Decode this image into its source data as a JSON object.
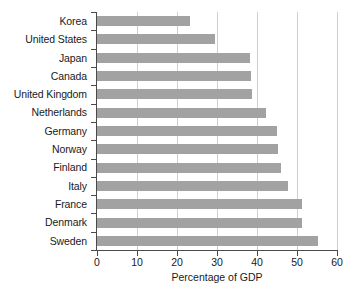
{
  "chart_data": {
    "type": "bar",
    "orientation": "horizontal",
    "title": "",
    "xlabel": "Percentage of GDP",
    "ylabel": "",
    "xlim": [
      0,
      60
    ],
    "xticks": [
      0,
      10,
      20,
      30,
      40,
      50,
      60
    ],
    "xtick_labels": [
      "0",
      "10",
      "20",
      "30",
      "40",
      "50",
      "60"
    ],
    "grid": "vertical",
    "legend": "none",
    "bar_color": "#a2a2a2",
    "background_color": "#ffffff",
    "axis_color": "#4a4a4a",
    "gridline_color": "#cfcfcf",
    "categories": [
      "Korea",
      "United States",
      "Japan",
      "Canada",
      "United Kingdom",
      "Netherlands",
      "Germany",
      "Norway",
      "Finland",
      "Italy",
      "France",
      "Denmark",
      "Sweden"
    ],
    "values": [
      23.3,
      29.5,
      38.3,
      38.5,
      38.8,
      42.3,
      45.0,
      45.2,
      46.0,
      47.8,
      51.3,
      51.3,
      55.2
    ]
  }
}
